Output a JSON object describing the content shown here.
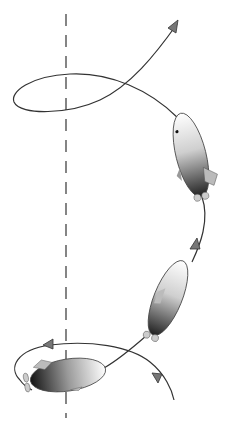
{
  "diagram": {
    "colors": {
      "background": "#ffffff",
      "path": "#333333",
      "axis": "#444444",
      "arrow": "#777777",
      "body_light": "#ffffff",
      "body_dark": "#1a1a1a",
      "fin": "#bbbbbb"
    },
    "axis": {
      "x": 66,
      "y_start": 14,
      "y_end": 418,
      "dash": "12,9"
    },
    "airships": [
      {
        "id": "top",
        "cx": 191,
        "cy": 155,
        "rx": 15,
        "ry": 43,
        "rotate": -14
      },
      {
        "id": "middle",
        "cx": 168,
        "cy": 298,
        "rx": 14,
        "ry": 40,
        "rotate": 22
      },
      {
        "id": "bottom",
        "cx": 68,
        "cy": 375,
        "rx": 38,
        "ry": 16,
        "rotate": -9
      }
    ],
    "arrowheads": [
      {
        "id": "top-exit",
        "x": 177,
        "y": 26
      },
      {
        "id": "mid-upper",
        "x": 196,
        "y": 244
      },
      {
        "id": "bottom-left",
        "x": 48,
        "y": 344
      },
      {
        "id": "bottom-right",
        "x": 158,
        "y": 378
      }
    ]
  }
}
